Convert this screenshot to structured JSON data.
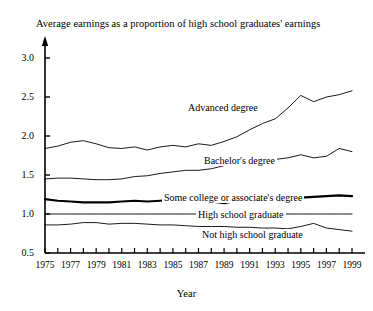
{
  "chart_data": {
    "type": "line",
    "title": "Average earnings as a proportion of high school graduates' earnings",
    "xlabel": "Year",
    "ylabel": "",
    "xlim": [
      1975,
      1999
    ],
    "ylim": [
      0.5,
      3.0
    ],
    "yticks": [
      "0.5",
      "1.0",
      "1.5",
      "2.0",
      "2.5",
      "3.0"
    ],
    "xticks": [
      "1975",
      "1977",
      "1979",
      "1981",
      "1983",
      "1985",
      "1987",
      "1989",
      "1991",
      "1993",
      "1995",
      "1997",
      "1999"
    ],
    "grid": false,
    "legend": "inline-labels",
    "x": [
      1975,
      1976,
      1977,
      1978,
      1979,
      1980,
      1981,
      1982,
      1983,
      1984,
      1985,
      1986,
      1987,
      1988,
      1989,
      1990,
      1991,
      1992,
      1993,
      1994,
      1995,
      1996,
      1997,
      1998,
      1999
    ],
    "series": [
      {
        "name": "Advanced degree",
        "label": "Advanced degree",
        "values": [
          1.84,
          1.87,
          1.92,
          1.94,
          1.9,
          1.85,
          1.84,
          1.86,
          1.82,
          1.86,
          1.88,
          1.86,
          1.9,
          1.88,
          1.93,
          1.99,
          2.08,
          2.16,
          2.22,
          2.36,
          2.52,
          2.44,
          2.5,
          2.53,
          2.58
        ],
        "style": "thin"
      },
      {
        "name": "Bachelor's degree",
        "label": "Bachelor's degree",
        "values": [
          1.45,
          1.46,
          1.46,
          1.45,
          1.44,
          1.44,
          1.45,
          1.48,
          1.49,
          1.52,
          1.54,
          1.56,
          1.56,
          1.58,
          1.62,
          1.64,
          1.65,
          1.68,
          1.7,
          1.72,
          1.76,
          1.72,
          1.74,
          1.84,
          1.8
        ],
        "style": "thin"
      },
      {
        "name": "Some college or associate's degree",
        "label": "Some college or associate's degree",
        "values": [
          1.19,
          1.17,
          1.16,
          1.15,
          1.15,
          1.15,
          1.16,
          1.17,
          1.16,
          1.17,
          1.18,
          1.17,
          1.19,
          1.16,
          1.14,
          1.17,
          1.18,
          1.19,
          1.2,
          1.21,
          1.21,
          1.22,
          1.23,
          1.24,
          1.23
        ],
        "style": "thick"
      },
      {
        "name": "High school graduate",
        "label": "High school graduate",
        "values": [
          1.0,
          1.0,
          1.0,
          1.0,
          1.0,
          1.0,
          1.0,
          1.0,
          1.0,
          1.0,
          1.0,
          1.0,
          1.0,
          1.0,
          1.0,
          1.0,
          1.0,
          1.0,
          1.0,
          1.0,
          1.0,
          1.0,
          1.0,
          1.0,
          1.0
        ],
        "style": "thin"
      },
      {
        "name": "Not high school graduate",
        "label": "Not high school graduate",
        "values": [
          0.86,
          0.86,
          0.87,
          0.89,
          0.89,
          0.87,
          0.88,
          0.88,
          0.87,
          0.86,
          0.86,
          0.85,
          0.84,
          0.84,
          0.84,
          0.83,
          0.83,
          0.82,
          0.82,
          0.81,
          0.84,
          0.88,
          0.82,
          0.8,
          0.78
        ],
        "style": "thin"
      }
    ],
    "series_label_positions": [
      {
        "label_key": "0",
        "x": 186,
        "y": 102
      },
      {
        "label_key": "1",
        "x": 202,
        "y": 155
      },
      {
        "label_key": "2",
        "x": 162,
        "y": 192
      },
      {
        "label_key": "3",
        "x": 196,
        "y": 209
      },
      {
        "label_key": "4",
        "x": 200,
        "y": 229
      }
    ]
  }
}
